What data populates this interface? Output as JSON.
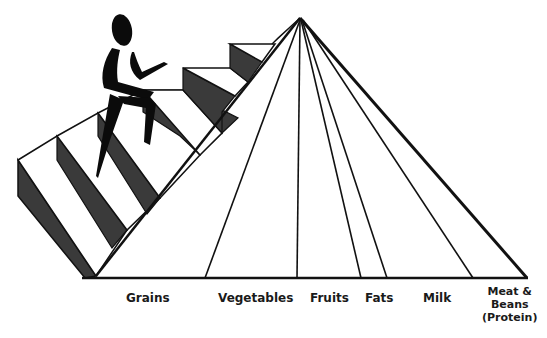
{
  "diagram": {
    "title": "",
    "staircase_label": "Exercise",
    "figure": "person-climbing-stairs",
    "pyramid_sections": [
      {
        "label": "Grains"
      },
      {
        "label": "Vegetables"
      },
      {
        "label": "Fruits"
      },
      {
        "label": "Fats"
      },
      {
        "label": "Milk"
      },
      {
        "label": "Meat &\nBeans\n(Protein)"
      }
    ],
    "colors": {
      "line": "#111111",
      "riser": "#3a3a3a",
      "tread": "#ffffff",
      "background": "#ffffff"
    }
  }
}
